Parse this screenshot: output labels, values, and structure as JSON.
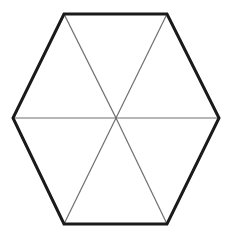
{
  "diagram": {
    "type": "regular-hexagon-divided-into-triangles",
    "width": 230,
    "height": 235,
    "background": "#ffffff",
    "outline": {
      "stroke": "#1a1a1a",
      "stroke_width": 3,
      "vertices": [
        [
          64,
          14
        ],
        [
          167,
          14
        ],
        [
          219,
          118
        ],
        [
          167,
          224
        ],
        [
          64,
          224
        ],
        [
          13,
          118
        ]
      ]
    },
    "center": [
      116,
      118
    ],
    "spokes": {
      "stroke": "#6e6e6e",
      "stroke_width": 1.2,
      "count": 6
    },
    "triangle_count": 6
  }
}
